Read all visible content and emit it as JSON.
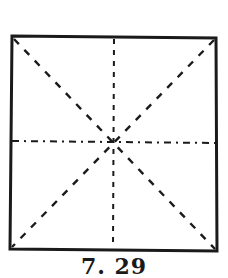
{
  "figure": {
    "caption": "7. 29",
    "stroke_color": "#1a1a1a",
    "background_color": "#ffffff",
    "square": {
      "top_left": [
        12,
        36
      ],
      "top_right": [
        216,
        38
      ],
      "bottom_right": [
        217,
        251
      ],
      "bottom_left": [
        10,
        249
      ]
    },
    "center": [
      115,
      142
    ],
    "fold_lines": [
      {
        "name": "vertical-center",
        "style": "dashed"
      },
      {
        "name": "horizontal-center",
        "style": "dash-dot"
      },
      {
        "name": "diagonal-tl-br",
        "style": "dashed"
      },
      {
        "name": "diagonal-tr-bl",
        "style": "dashed"
      }
    ]
  }
}
